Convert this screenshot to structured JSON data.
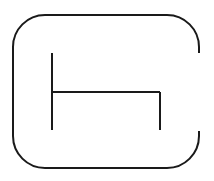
{
  "diagram": {
    "canvas": {
      "width": 214,
      "height": 181,
      "background": "#ffffff"
    },
    "stroke_color": "#1a1a1a",
    "stroke_width": 2,
    "outer_shape": {
      "type": "rounded-rect-open-right",
      "left": 13,
      "top": 15,
      "right": 199,
      "bottom": 168,
      "radius": 32,
      "gap_top": 53,
      "gap_bottom": 131
    },
    "inner_lines": [
      {
        "name": "left-vertical",
        "x1": 52,
        "y1": 53,
        "x2": 52,
        "y2": 130
      },
      {
        "name": "horizontal",
        "x1": 52,
        "y1": 92,
        "x2": 160,
        "y2": 92
      },
      {
        "name": "right-vertical",
        "x1": 160,
        "y1": 92,
        "x2": 160,
        "y2": 130
      }
    ]
  }
}
